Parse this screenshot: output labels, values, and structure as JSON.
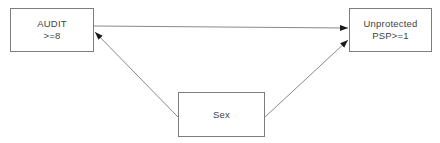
{
  "diagram": {
    "type": "path-diagram",
    "nodes": [
      {
        "id": "audit",
        "lines": [
          "AUDIT",
          ">=8"
        ]
      },
      {
        "id": "unprotected",
        "lines": [
          "Unprotected",
          "PSP>=1"
        ]
      },
      {
        "id": "sex",
        "lines": [
          "Sex"
        ]
      }
    ],
    "edges": [
      {
        "from": "audit",
        "to": "unprotected",
        "arrowhead_at": "unprotected"
      },
      {
        "from": "sex",
        "to": "audit",
        "arrowhead_at": "audit"
      },
      {
        "from": "sex",
        "to": "unprotected",
        "arrowhead_at": "unprotected"
      }
    ],
    "colors": {
      "background": "#ffffff",
      "box_border": "#7d7d7d",
      "edge_line": "#8a8a8a",
      "arrowhead": "#1a1a1a",
      "text": "#3f3f3f"
    }
  }
}
